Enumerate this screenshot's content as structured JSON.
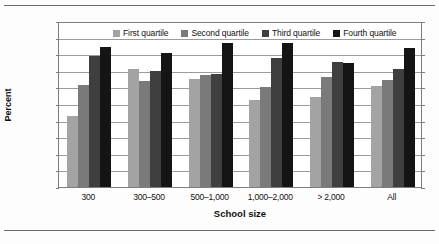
{
  "chart_data": {
    "type": "bar",
    "title": "",
    "xlabel": "School size",
    "ylabel": "Percent",
    "ylim": [
      0,
      100
    ],
    "ytick_step": 10,
    "yticks": [
      "0",
      "10",
      "20",
      "30",
      "40",
      "50",
      "60",
      "70",
      "80",
      "90",
      "100"
    ],
    "grid": true,
    "legend_position": "top-center",
    "categories": [
      "300",
      "300–500",
      "500–1,000",
      "1,000–2,000",
      "> 2,000",
      "All"
    ],
    "series": [
      {
        "name": "First quartile",
        "color": "#a3a3a3",
        "values": [
          42.5,
          71,
          65,
          52.5,
          54,
          61
        ]
      },
      {
        "name": "Second quartile",
        "color": "#7a7a7a",
        "values": [
          61.5,
          64,
          67.5,
          60,
          66,
          64.5
        ]
      },
      {
        "name": "Third quartile",
        "color": "#3f3f3f",
        "values": [
          79,
          70,
          68,
          77.5,
          75.5,
          71
        ]
      },
      {
        "name": "Fourth quartile",
        "color": "#141414",
        "values": [
          84.5,
          81,
          87,
          87,
          74.5,
          83.5
        ]
      }
    ]
  }
}
